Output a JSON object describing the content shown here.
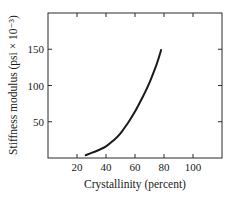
{
  "chart_data": {
    "type": "line",
    "title": "",
    "xlabel": "Crystallinity (percent)",
    "ylabel": "Stiffness modulus (psi × 10⁻³)",
    "xlim": [
      0,
      120
    ],
    "ylim": [
      0,
      200
    ],
    "x_ticks": [
      20,
      40,
      60,
      80,
      100
    ],
    "y_ticks": [
      50,
      100,
      150
    ],
    "grid": false,
    "legend": null,
    "series": [
      {
        "name": "Stiffness modulus",
        "x": [
          26,
          30,
          35,
          40,
          45,
          50,
          55,
          60,
          65,
          70,
          75,
          78
        ],
        "y": [
          4,
          7,
          11,
          16,
          24,
          34,
          48,
          64,
          83,
          104,
          130,
          149
        ]
      }
    ]
  },
  "colors": {
    "axis": "#2a2a2a",
    "line": "#1a1a1a",
    "background": "#ffffff"
  }
}
